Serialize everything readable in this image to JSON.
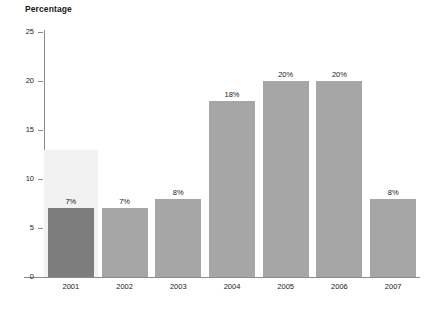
{
  "chart_data": {
    "type": "bar",
    "title": "Percentage",
    "subtitle": "",
    "xlabel": "",
    "ylabel": "Percentage",
    "categories": [
      "2001",
      "2002",
      "2003",
      "2004",
      "2005",
      "2006",
      "2007"
    ],
    "values": [
      7,
      7,
      8,
      18,
      20,
      20,
      8
    ],
    "data_labels": [
      "7%",
      "7%",
      "8%",
      "18%",
      "20%",
      "20%",
      "8%"
    ],
    "ylim": [
      0,
      25
    ],
    "y_ticks": [
      "0",
      "5",
      "10",
      "15",
      "20",
      "25"
    ],
    "y_tick_values": [
      0,
      5,
      10,
      15,
      20,
      25
    ],
    "grid": false,
    "legend": "none",
    "highlighted_category": "2001",
    "colors": {
      "bar": "#a6a6a6",
      "bar_highlight": "#7d7d7d",
      "highlight_band": "#f2f2f2",
      "axis": "#8c8c8c",
      "text": "#1a1a1a"
    }
  }
}
